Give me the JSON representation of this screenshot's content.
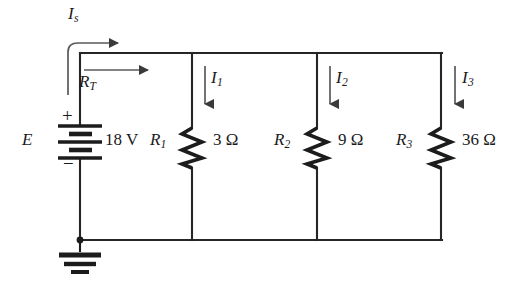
{
  "diagram": {
    "stroke_color": "#262626",
    "text_color": "#1a1a1a",
    "source": {
      "symbol_name": "battery",
      "designator": "E",
      "value": "18 V",
      "plus_sign": "+",
      "minus_sign": "−"
    },
    "ground": {
      "symbol_name": "earth-ground"
    },
    "currents": [
      {
        "name": "Is",
        "label_letter": "I",
        "label_sub": "s",
        "direction": "right"
      },
      {
        "name": "I1",
        "label_letter": "I",
        "label_sub": "1",
        "direction": "down"
      },
      {
        "name": "I2",
        "label_letter": "I",
        "label_sub": "2",
        "direction": "down"
      },
      {
        "name": "I3",
        "label_letter": "I",
        "label_sub": "3",
        "direction": "down"
      }
    ],
    "total_resistance": {
      "label_letter": "R",
      "label_sub": "T",
      "direction": "right"
    },
    "resistors": [
      {
        "designator_letter": "R",
        "designator_sub": "1",
        "value": "3 Ω",
        "branch_current": "I1"
      },
      {
        "designator_letter": "R",
        "designator_sub": "2",
        "value": "9 Ω",
        "branch_current": "I2"
      },
      {
        "designator_letter": "R",
        "designator_sub": "3",
        "value": "36 Ω",
        "branch_current": "I3"
      }
    ]
  }
}
